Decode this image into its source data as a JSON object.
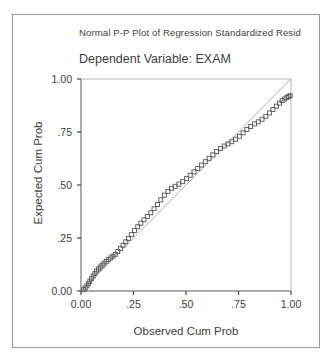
{
  "window": {
    "background": "#ffffff",
    "border_color": "#9a9a9a"
  },
  "chart_data": {
    "type": "scatter",
    "title": "Normal P-P Plot of Regression Standardized Resid",
    "subtitle": "Dependent Variable: EXAM",
    "xlabel": "Observed Cum Prob",
    "ylabel": "Expected Cum Prob",
    "xlim": [
      0.0,
      1.0
    ],
    "ylim": [
      0.0,
      1.0
    ],
    "grid": false,
    "legend": "none",
    "xticks": [
      0.0,
      0.25,
      0.5,
      0.75,
      1.0
    ],
    "yticks": [
      0.0,
      0.25,
      0.5,
      0.75,
      1.0
    ],
    "xticklabels": [
      "0.00",
      ".25",
      ".50",
      ".75",
      "1.00"
    ],
    "yticklabels": [
      "0.00",
      ".25",
      ".50",
      ".75",
      "1.00"
    ],
    "marker": "open-square",
    "marker_size": 4,
    "marker_color": "#555555",
    "reference_line": {
      "from": [
        0.0,
        0.0
      ],
      "to": [
        1.0,
        1.0
      ],
      "color": "#9b9b9b",
      "width": 0.8
    },
    "axis_color": "#5a5a5a",
    "series": [
      {
        "name": "Observed vs Expected Cum Prob",
        "x": [
          0.012,
          0.02,
          0.028,
          0.035,
          0.042,
          0.05,
          0.058,
          0.066,
          0.074,
          0.083,
          0.092,
          0.101,
          0.11,
          0.12,
          0.13,
          0.141,
          0.152,
          0.163,
          0.175,
          0.188,
          0.2,
          0.213,
          0.226,
          0.24,
          0.255,
          0.27,
          0.285,
          0.3,
          0.316,
          0.332,
          0.348,
          0.364,
          0.38,
          0.397,
          0.414,
          0.431,
          0.448,
          0.466,
          0.484,
          0.502,
          0.52,
          0.538,
          0.556,
          0.574,
          0.592,
          0.61,
          0.628,
          0.646,
          0.664,
          0.682,
          0.7,
          0.718,
          0.736,
          0.754,
          0.772,
          0.79,
          0.808,
          0.826,
          0.844,
          0.862,
          0.88,
          0.898,
          0.914,
          0.93,
          0.945,
          0.958,
          0.97,
          0.98,
          0.988,
          0.996
        ],
        "y": [
          0.006,
          0.014,
          0.024,
          0.034,
          0.046,
          0.058,
          0.07,
          0.082,
          0.094,
          0.104,
          0.113,
          0.122,
          0.131,
          0.14,
          0.148,
          0.156,
          0.164,
          0.173,
          0.186,
          0.2,
          0.216,
          0.232,
          0.248,
          0.266,
          0.285,
          0.303,
          0.32,
          0.336,
          0.352,
          0.369,
          0.388,
          0.408,
          0.43,
          0.452,
          0.47,
          0.484,
          0.494,
          0.504,
          0.516,
          0.53,
          0.546,
          0.562,
          0.578,
          0.594,
          0.61,
          0.626,
          0.642,
          0.658,
          0.672,
          0.684,
          0.694,
          0.704,
          0.716,
          0.73,
          0.746,
          0.762,
          0.776,
          0.788,
          0.798,
          0.81,
          0.824,
          0.84,
          0.856,
          0.872,
          0.886,
          0.898,
          0.906,
          0.912,
          0.917,
          0.921
        ]
      }
    ]
  }
}
